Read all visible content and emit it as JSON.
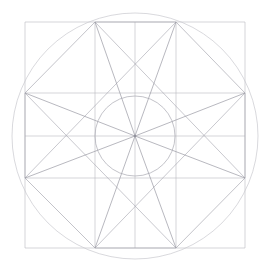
{
  "figure": {
    "background_color": "#ffffff",
    "canvas": {
      "width": 268,
      "height": 273
    }
  },
  "geometry": {
    "center": {
      "x": 135,
      "y": 136
    },
    "outer_circle": {
      "name": "circumscribed-circle",
      "cx": 135,
      "cy": 136,
      "r": 123,
      "color": "#c9c9cf",
      "stroke_width": 0.7
    },
    "inner_circle": {
      "name": "inner-circle",
      "cx": 135,
      "cy": 136,
      "r": 40,
      "color": "#a9a9b2",
      "stroke_width": 0.7
    },
    "octagon": {
      "name": "regular-octagon",
      "sides": 8,
      "color": "#a9a9b2",
      "stroke_width": 0.7,
      "vertices": [
        {
          "label": "top-left",
          "x": 95,
          "y": 22
        },
        {
          "label": "top-right",
          "x": 176,
          "y": 22
        },
        {
          "label": "right-top",
          "x": 245,
          "y": 93
        },
        {
          "label": "right-bottom",
          "x": 245,
          "y": 178
        },
        {
          "label": "bottom-right",
          "x": 176,
          "y": 248
        },
        {
          "label": "bottom-left",
          "x": 95,
          "y": 248
        },
        {
          "label": "left-bottom",
          "x": 25,
          "y": 178
        },
        {
          "label": "left-top",
          "x": 25,
          "y": 93
        }
      ]
    },
    "grid": {
      "name": "orthogonal-grid",
      "color": "#b9b9c0",
      "stroke_width": 0.6,
      "vertical_lines_x": [
        25,
        95,
        135,
        176,
        245
      ],
      "horizontal_lines_y": [
        22,
        93,
        136,
        178,
        248
      ],
      "extent": {
        "x_min": 25,
        "x_max": 245,
        "y_min": 22,
        "y_max": 248
      }
    },
    "spokes": {
      "name": "radial-spokes",
      "color": "#9a9aa4",
      "stroke_width": 0.7,
      "count": 8,
      "targets": [
        {
          "label": "spoke-to-top-left",
          "x": 95,
          "y": 22
        },
        {
          "label": "spoke-to-top-right",
          "x": 176,
          "y": 22
        },
        {
          "label": "spoke-to-right-top",
          "x": 245,
          "y": 93
        },
        {
          "label": "spoke-to-right-bottom",
          "x": 245,
          "y": 178
        },
        {
          "label": "spoke-to-bottom-right",
          "x": 176,
          "y": 248
        },
        {
          "label": "spoke-to-bottom-left",
          "x": 95,
          "y": 248
        },
        {
          "label": "spoke-to-left-bottom",
          "x": 25,
          "y": 178
        },
        {
          "label": "spoke-to-left-top",
          "x": 25,
          "y": 93
        }
      ]
    },
    "chords": {
      "name": "octagon-diagonal-chords",
      "color": "#a3a3ac",
      "stroke_width": 0.6,
      "segments": [
        {
          "label": "chord-topleft-to-rightbottom",
          "x1": 95,
          "y1": 22,
          "x2": 245,
          "y2": 178
        },
        {
          "label": "chord-topright-to-leftbottom",
          "x1": 176,
          "y1": 22,
          "x2": 25,
          "y2": 178
        },
        {
          "label": "chord-lefttop-to-bottomright",
          "x1": 25,
          "y1": 93,
          "x2": 176,
          "y2": 248
        },
        {
          "label": "chord-righttop-to-bottomleft",
          "x1": 245,
          "y1": 93,
          "x2": 95,
          "y2": 248
        }
      ]
    }
  }
}
